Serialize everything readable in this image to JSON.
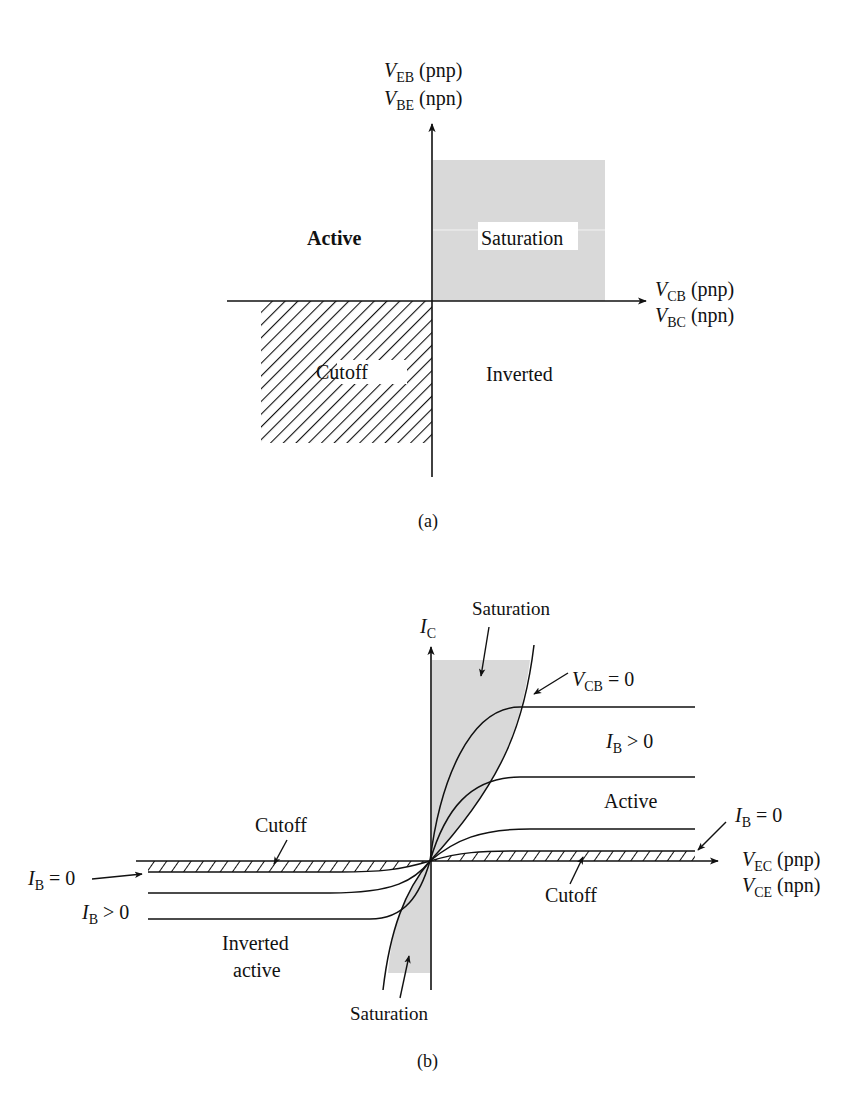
{
  "colors": {
    "ink": "#111111",
    "shade": "#d9d9d9",
    "background": "#ffffff"
  },
  "panel_a": {
    "caption": "(a)",
    "y_axis": {
      "line1_main": "V",
      "line1_sub": "EB",
      "line1_note": " (pnp)",
      "line2_main": "V",
      "line2_sub": "BE",
      "line2_note": " (npn)"
    },
    "x_axis": {
      "line1_main": "V",
      "line1_sub": "CB",
      "line1_note": " (pnp)",
      "line2_main": "V",
      "line2_sub": "BC",
      "line2_note": " (npn)"
    },
    "regions": {
      "active": "Active",
      "saturation": "Saturation",
      "cutoff": "Cutoff",
      "inverted": "Inverted"
    }
  },
  "panel_b": {
    "caption": "(b)",
    "y_axis": {
      "main": "I",
      "sub": "C"
    },
    "x_axis": {
      "line1_main": "V",
      "line1_sub": "EC",
      "line1_note": " (pnp)",
      "line2_main": "V",
      "line2_sub": "CE",
      "line2_note": " (npn)"
    },
    "labels": {
      "saturation_top": "Saturation",
      "vcb_main": "V",
      "vcb_sub": "CB",
      "vcb_rest": " = 0",
      "ib_pos_right_main": "I",
      "ib_pos_right_sub": "B",
      "ib_pos_right_rest": " > 0",
      "active": "Active",
      "ib_zero_right_main": "I",
      "ib_zero_right_sub": "B",
      "ib_zero_right_rest": " = 0",
      "cutoff_right": "Cutoff",
      "cutoff_left": "Cutoff",
      "ib_zero_left_main": "I",
      "ib_zero_left_sub": "B",
      "ib_zero_left_rest": " = 0",
      "ib_pos_left_main": "I",
      "ib_pos_left_sub": "B",
      "ib_pos_left_rest": " > 0",
      "inverted_line1": "Inverted",
      "inverted_line2": "active",
      "saturation_bottom": "Saturation"
    }
  }
}
